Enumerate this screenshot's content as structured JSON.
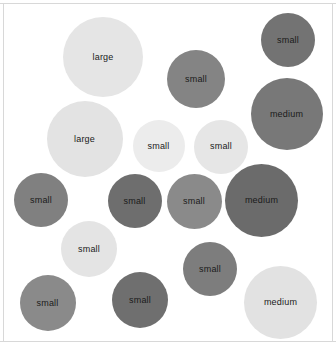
{
  "figure": {
    "name": "bubble-cluster-chart",
    "background_color": "#ffffff",
    "frame_color": "#d8d8d8"
  },
  "chart_data": {
    "type": "scatter",
    "title": "",
    "subtitle": "",
    "xlabel": "",
    "ylabel": "",
    "grid": false,
    "legend": null,
    "axis_visible": false,
    "xlim": [
      0,
      336
    ],
    "ylim": [
      0,
      350
    ],
    "size_categories": [
      "small",
      "medium",
      "large"
    ],
    "palette": {
      "light": "#e3e3e3",
      "light_alt": "#ececec",
      "mid_gray": "#8c8c8c",
      "dark_gray": "#767676",
      "darker_gray": "#6b6b6b"
    },
    "points": [
      {
        "label": "large",
        "x": 103,
        "y": 57,
        "r": 40,
        "color": "#e5e5e5",
        "text_color": "#1a1a1a"
      },
      {
        "label": "small",
        "x": 196,
        "y": 79,
        "r": 29,
        "color": "#848484",
        "text_color": "#1a1a1a"
      },
      {
        "label": "small",
        "x": 288,
        "y": 40,
        "r": 27,
        "color": "#737373",
        "text_color": "#1a1a1a"
      },
      {
        "label": "medium",
        "x": 286.5,
        "y": 114,
        "r": 36,
        "color": "#787878",
        "text_color": "#1a1a1a"
      },
      {
        "label": "large",
        "x": 84.5,
        "y": 139,
        "r": 38,
        "color": "#e3e3e3",
        "text_color": "#1a1a1a"
      },
      {
        "label": "small",
        "x": 158.5,
        "y": 146,
        "r": 26,
        "color": "#ececec",
        "text_color": "#1a1a1a"
      },
      {
        "label": "small",
        "x": 221,
        "y": 146.5,
        "r": 27,
        "color": "#e6e6e6",
        "text_color": "#1a1a1a"
      },
      {
        "label": "small",
        "x": 41,
        "y": 200,
        "r": 27,
        "color": "#808080",
        "text_color": "#1a1a1a"
      },
      {
        "label": "small",
        "x": 134.5,
        "y": 201,
        "r": 27,
        "color": "#6e6e6e",
        "text_color": "#1a1a1a"
      },
      {
        "label": "small",
        "x": 194,
        "y": 201,
        "r": 27.5,
        "color": "#8a8a8a",
        "text_color": "#1a1a1a"
      },
      {
        "label": "medium",
        "x": 261.5,
        "y": 200,
        "r": 36.5,
        "color": "#6b6b6b",
        "text_color": "#1a1a1a"
      },
      {
        "label": "small",
        "x": 89,
        "y": 249,
        "r": 28,
        "color": "#e4e4e4",
        "text_color": "#1a1a1a"
      },
      {
        "label": "small",
        "x": 210,
        "y": 269,
        "r": 27,
        "color": "#7d7d7d",
        "text_color": "#1a1a1a"
      },
      {
        "label": "small",
        "x": 47.5,
        "y": 303,
        "r": 28,
        "color": "#8a8a8a",
        "text_color": "#1a1a1a"
      },
      {
        "label": "small",
        "x": 140,
        "y": 300,
        "r": 28,
        "color": "#6f6f6f",
        "text_color": "#1a1a1a"
      },
      {
        "label": "medium",
        "x": 280.5,
        "y": 302.5,
        "r": 36.5,
        "color": "#e2e2e2",
        "text_color": "#1a1a1a"
      }
    ]
  }
}
